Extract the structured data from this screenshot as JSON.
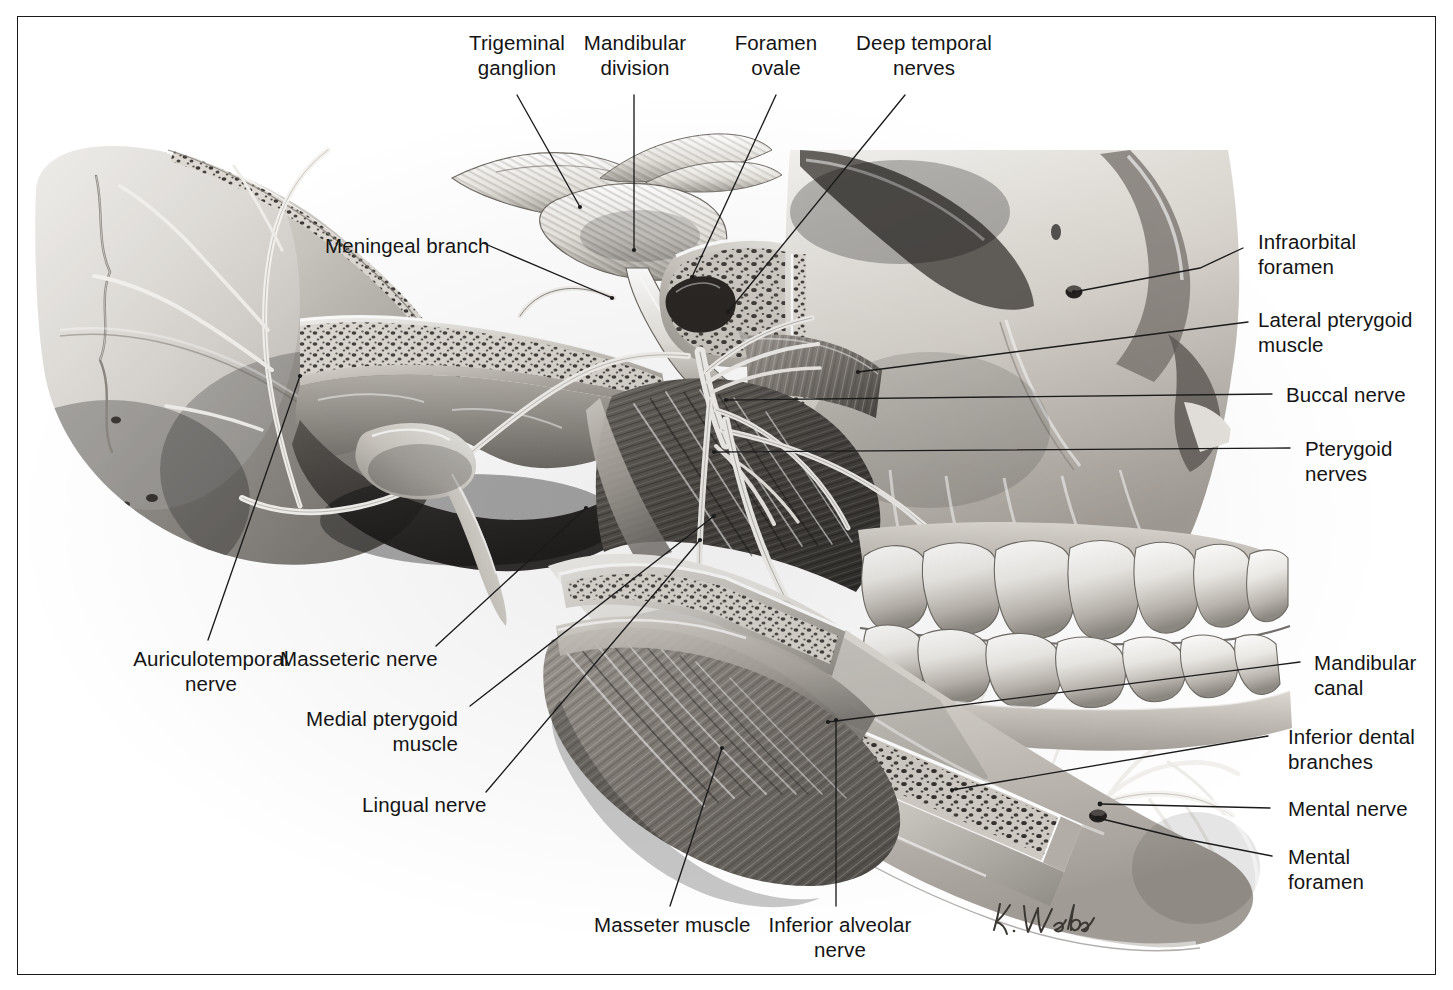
{
  "plate": {
    "kind": "anatomical-illustration",
    "subject": "Mandibular division of the trigeminal nerve (CN V3) in the infratemporal fossa",
    "rendering": "grayscale pencil/airbrush medical illustration",
    "signature": "K. Wesker",
    "frame_color": "#1a1a1a",
    "background_color": "#ffffff",
    "label_color": "#141414"
  },
  "labels": {
    "trigeminal_ganglion": "Trigeminal\nganglion",
    "mandibular_division": "Mandibular\ndivision",
    "foramen_ovale": "Foramen\novale",
    "deep_temporal_nerves": "Deep temporal\nnerves",
    "meningeal_branch": "Meningeal branch",
    "infraorbital_foramen": "Infraorbital\nforamen",
    "lateral_pterygoid_muscle": "Lateral pterygoid\nmuscle",
    "buccal_nerve": "Buccal nerve",
    "pterygoid_nerves": "Pterygoid\nnerves",
    "mandibular_canal": "Mandibular\ncanal",
    "inferior_dental_branches": "Inferior dental\nbranches",
    "mental_nerve": "Mental nerve",
    "mental_foramen": "Mental\nforamen",
    "auriculotemporal_nerve": "Auriculotemporal\nnerve",
    "masseteric_nerve": "Masseteric nerve",
    "medial_pterygoid_muscle": "Medial pterygoid\nmuscle",
    "lingual_nerve": "Lingual nerve",
    "masseter_muscle": "Masseter muscle",
    "inferior_alveolar_nerve": "Inferior alveolar\nnerve"
  },
  "structures": [
    {
      "name": "trigeminal-ganglion",
      "type": "nerve-ganglion"
    },
    {
      "name": "mandibular-division",
      "type": "nerve-trunk"
    },
    {
      "name": "foramen-ovale",
      "type": "bony-foramen"
    },
    {
      "name": "deep-temporal-nerves",
      "type": "nerve-branches"
    },
    {
      "name": "meningeal-branch",
      "type": "nerve-branch"
    },
    {
      "name": "infraorbital-foramen",
      "type": "bony-foramen"
    },
    {
      "name": "lateral-pterygoid-muscle",
      "type": "muscle"
    },
    {
      "name": "buccal-nerve",
      "type": "nerve-branch"
    },
    {
      "name": "pterygoid-nerves",
      "type": "nerve-branches"
    },
    {
      "name": "mandibular-canal",
      "type": "bony-canal"
    },
    {
      "name": "inferior-dental-branches",
      "type": "nerve-branches"
    },
    {
      "name": "mental-nerve",
      "type": "nerve-branch"
    },
    {
      "name": "mental-foramen",
      "type": "bony-foramen"
    },
    {
      "name": "auriculotemporal-nerve",
      "type": "nerve-branch"
    },
    {
      "name": "masseteric-nerve",
      "type": "nerve-branch"
    },
    {
      "name": "medial-pterygoid-muscle",
      "type": "muscle"
    },
    {
      "name": "lingual-nerve",
      "type": "nerve-branch"
    },
    {
      "name": "masseter-muscle",
      "type": "muscle"
    },
    {
      "name": "inferior-alveolar-nerve",
      "type": "nerve-trunk"
    }
  ]
}
